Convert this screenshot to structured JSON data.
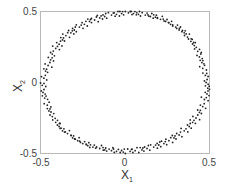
{
  "chart_data": {
    "type": "scatter",
    "title": "",
    "xlabel": "X",
    "xlabel_sub": "1",
    "ylabel": "X",
    "ylabel_sub": "2",
    "xlim": [
      -0.5,
      0.5
    ],
    "ylim": [
      -0.5,
      0.5
    ],
    "xticks": [
      -0.5,
      0,
      0.5
    ],
    "yticks": [
      -0.5,
      0,
      0.5
    ],
    "xtick_labels": [
      "-0.5",
      "0",
      "0.5"
    ],
    "ytick_labels": [
      "-0.5",
      "0",
      "0.5"
    ],
    "grid": false,
    "legend": null,
    "marker_color": "#222222",
    "series": [
      {
        "name": "points",
        "x": [
          0.48,
          0.475,
          0.46,
          0.455,
          0.44,
          0.43,
          0.41,
          0.39,
          0.37,
          0.35,
          0.32,
          0.3,
          0.27,
          0.24,
          0.21,
          0.18,
          0.15,
          0.12,
          0.08,
          0.05,
          0.02,
          -0.02,
          -0.05,
          -0.08,
          -0.12,
          -0.15,
          -0.18,
          -0.21,
          -0.24,
          -0.27,
          -0.3,
          -0.32,
          -0.35,
          -0.37,
          -0.39,
          -0.41,
          -0.43,
          -0.44,
          -0.455,
          -0.47,
          -0.48,
          -0.49,
          -0.485,
          -0.475,
          -0.46,
          -0.45,
          -0.43,
          -0.41,
          -0.39,
          -0.37,
          -0.34,
          -0.31,
          -0.28,
          -0.25,
          -0.22,
          -0.19,
          -0.15,
          -0.12,
          -0.08,
          -0.05,
          -0.01,
          0.03,
          0.06,
          0.1,
          0.13,
          0.17,
          0.2,
          0.23,
          0.26,
          0.29,
          0.32,
          0.35,
          0.38,
          0.4,
          0.42,
          0.44,
          0.46,
          0.47,
          0.485,
          0.49
        ],
        "y": [
          0.0,
          0.05,
          0.1,
          0.14,
          0.18,
          0.22,
          0.26,
          0.29,
          0.32,
          0.35,
          0.37,
          0.39,
          0.41,
          0.43,
          0.445,
          0.46,
          0.465,
          0.475,
          0.48,
          0.485,
          0.49,
          0.485,
          0.48,
          0.475,
          0.465,
          0.455,
          0.44,
          0.43,
          0.41,
          0.39,
          0.37,
          0.35,
          0.33,
          0.3,
          0.27,
          0.24,
          0.2,
          0.16,
          0.12,
          0.08,
          0.03,
          -0.02,
          -0.07,
          -0.11,
          -0.16,
          -0.2,
          -0.24,
          -0.28,
          -0.31,
          -0.34,
          -0.36,
          -0.39,
          -0.41,
          -0.43,
          -0.445,
          -0.455,
          -0.465,
          -0.475,
          -0.48,
          -0.485,
          -0.49,
          -0.485,
          -0.48,
          -0.475,
          -0.465,
          -0.455,
          -0.44,
          -0.43,
          -0.41,
          -0.39,
          -0.37,
          -0.34,
          -0.31,
          -0.28,
          -0.25,
          -0.21,
          -0.17,
          -0.12,
          -0.08,
          -0.04
        ]
      }
    ]
  },
  "axes": {
    "x_tick_labels": [
      "-0.5",
      "0",
      "0.5"
    ],
    "y_tick_labels": [
      "-0.5",
      "0",
      "0.5"
    ],
    "xlabel": "X",
    "xlabel_sub": "1",
    "ylabel": "X",
    "ylabel_sub": "2"
  }
}
